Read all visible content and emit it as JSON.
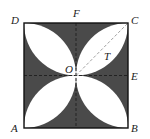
{
  "diagram": {
    "type": "geometry",
    "colors": {
      "shade": "#4a4a4a",
      "petal": "#ffffff",
      "stroke": "#111111",
      "dash": "#222222",
      "diag": "#cccccc"
    },
    "labels": {
      "A": "A",
      "B": "B",
      "C": "C",
      "D": "D",
      "E": "E",
      "F": "F",
      "O": "O",
      "T": "T"
    }
  }
}
